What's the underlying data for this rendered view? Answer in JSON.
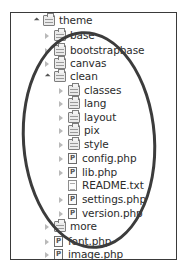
{
  "tree": {
    "items": [
      {
        "label": "theme",
        "level": 0,
        "state": "expanded",
        "type": "package-folder"
      },
      {
        "label": "base",
        "level": 1,
        "state": "collapsed",
        "type": "package-folder"
      },
      {
        "label": "bootstrapbase",
        "level": 1,
        "state": "collapsed",
        "type": "package-folder"
      },
      {
        "label": "canvas",
        "level": 1,
        "state": "collapsed",
        "type": "package-folder"
      },
      {
        "label": "clean",
        "level": 1,
        "state": "expanded",
        "type": "package-folder"
      },
      {
        "label": "classes",
        "level": 2,
        "state": "collapsed",
        "type": "package-folder"
      },
      {
        "label": "lang",
        "level": 2,
        "state": "collapsed",
        "type": "package-folder"
      },
      {
        "label": "layout",
        "level": 2,
        "state": "collapsed",
        "type": "package-folder"
      },
      {
        "label": "pix",
        "level": 2,
        "state": "collapsed",
        "type": "package-folder"
      },
      {
        "label": "style",
        "level": 2,
        "state": "collapsed",
        "type": "package-folder"
      },
      {
        "label": "config.php",
        "level": 2,
        "state": "collapsed",
        "type": "php-file"
      },
      {
        "label": "lib.php",
        "level": 2,
        "state": "collapsed",
        "type": "php-file"
      },
      {
        "label": "README.txt",
        "level": 2,
        "state": "none",
        "type": "text-file"
      },
      {
        "label": "settings.php",
        "level": 2,
        "state": "collapsed",
        "type": "php-file"
      },
      {
        "label": "version.php",
        "level": 2,
        "state": "collapsed",
        "type": "php-file"
      },
      {
        "label": "more",
        "level": 1,
        "state": "collapsed",
        "type": "package-folder"
      },
      {
        "label": "font.php",
        "level": 1,
        "state": "collapsed",
        "type": "php-file"
      },
      {
        "label": "image.php",
        "level": 1,
        "state": "collapsed",
        "type": "php-file"
      }
    ]
  },
  "annotation": {
    "shape": "ellipse",
    "color": "#3c3c3c",
    "highlights": "clean"
  },
  "php_icon_glyph": "P"
}
